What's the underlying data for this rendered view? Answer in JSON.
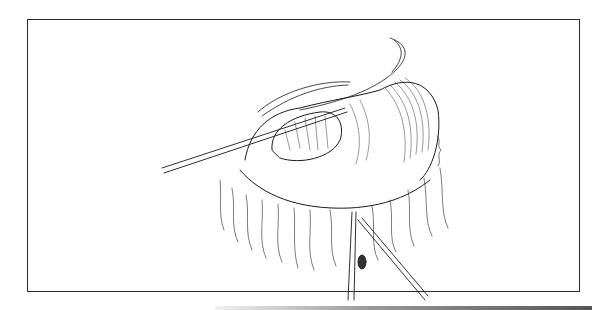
{
  "figure": {
    "type": "surgical line illustration",
    "border_color": "#2a2a2a",
    "ink_color": "#1a1a1a",
    "background": "#ffffff",
    "elements": [
      "retracted tissue flap",
      "organ with mesentery",
      "left retractor instrument",
      "lower forceps instrument",
      "artist signature mark"
    ]
  }
}
